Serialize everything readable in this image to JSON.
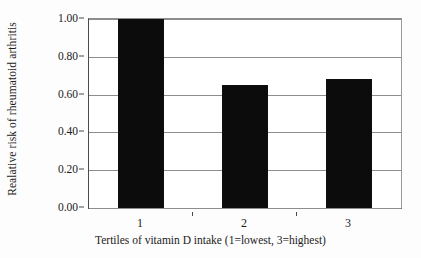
{
  "chart_data": {
    "type": "bar",
    "title": "",
    "subtitle": "",
    "xlabel": "Tertiles of vitamin D intake (1=lowest, 3=highest)",
    "ylabel": "Realative risk of rheumatoid arthritis",
    "categories": [
      "1",
      "2",
      "3"
    ],
    "values": [
      1.0,
      0.65,
      0.68
    ],
    "ylim": [
      0.0,
      1.0
    ],
    "ytick_values": [
      0.0,
      0.2,
      0.4,
      0.6,
      0.8,
      1.0
    ],
    "ytick_labels": [
      "0.00",
      "0.20",
      "0.40",
      "0.60",
      "0.80",
      "1.00"
    ],
    "xtick_labels": [
      "1",
      "2",
      "3"
    ],
    "grid": true,
    "legend": false,
    "legend_position": "none",
    "bar_color": "#0c0c0c",
    "grid_color": "#8d8d8d",
    "axis_color": "#4a4a4a",
    "background_color": "#ffffff",
    "annotations": []
  }
}
